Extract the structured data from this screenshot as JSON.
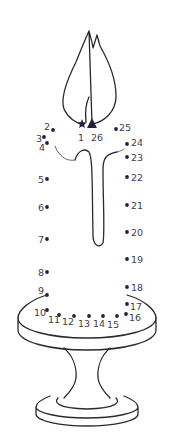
{
  "puzzle": {
    "type": "connect-the-dots",
    "subject": "candle on holder",
    "colors": {
      "dot": "#1e2240",
      "line": "#2a2a2a",
      "label": "#3d3d4a",
      "background": "#ffffff"
    },
    "start_marker": {
      "label": "1",
      "shape": "star",
      "x": 82,
      "y": 124,
      "lx": 78,
      "ly": 141
    },
    "end_marker": {
      "label": "26",
      "shape": "triangle",
      "x": 92,
      "y": 124,
      "lx": 91,
      "ly": 141
    },
    "dots": [
      {
        "label": "2",
        "x": 53,
        "y": 130,
        "lx": 44,
        "ly": 130
      },
      {
        "label": "3",
        "x": 44,
        "y": 137,
        "lx": 36,
        "ly": 142
      },
      {
        "label": "4",
        "x": 47,
        "y": 143,
        "lx": 39,
        "ly": 151
      },
      {
        "label": "5",
        "x": 47,
        "y": 179,
        "lx": 38,
        "ly": 183
      },
      {
        "label": "6",
        "x": 47,
        "y": 207,
        "lx": 38,
        "ly": 211
      },
      {
        "label": "7",
        "x": 47,
        "y": 239,
        "lx": 38,
        "ly": 243
      },
      {
        "label": "8",
        "x": 47,
        "y": 272,
        "lx": 38,
        "ly": 276
      },
      {
        "label": "9",
        "x": 47,
        "y": 295,
        "lx": 38,
        "ly": 294
      },
      {
        "label": "10",
        "x": 47,
        "y": 310,
        "lx": 34,
        "ly": 316
      },
      {
        "label": "11",
        "x": 59,
        "y": 315,
        "lx": 48,
        "ly": 323
      },
      {
        "label": "12",
        "x": 74,
        "y": 316,
        "lx": 62,
        "ly": 325
      },
      {
        "label": "13",
        "x": 89,
        "y": 316,
        "lx": 78,
        "ly": 327
      },
      {
        "label": "14",
        "x": 103,
        "y": 316,
        "lx": 93,
        "ly": 327
      },
      {
        "label": "15",
        "x": 117,
        "y": 316,
        "lx": 107,
        "ly": 328
      },
      {
        "label": "16",
        "x": 126,
        "y": 314,
        "lx": 129,
        "ly": 321
      },
      {
        "label": "17",
        "x": 127,
        "y": 304,
        "lx": 130,
        "ly": 310
      },
      {
        "label": "18",
        "x": 127,
        "y": 287,
        "lx": 131,
        "ly": 291
      },
      {
        "label": "19",
        "x": 127,
        "y": 259,
        "lx": 131,
        "ly": 263
      },
      {
        "label": "20",
        "x": 127,
        "y": 232,
        "lx": 131,
        "ly": 236
      },
      {
        "label": "21",
        "x": 127,
        "y": 205,
        "lx": 131,
        "ly": 209
      },
      {
        "label": "22",
        "x": 127,
        "y": 177,
        "lx": 131,
        "ly": 181
      },
      {
        "label": "23",
        "x": 127,
        "y": 157,
        "lx": 131,
        "ly": 161
      },
      {
        "label": "24",
        "x": 127,
        "y": 144,
        "lx": 131,
        "ly": 146
      },
      {
        "label": "25",
        "x": 116,
        "y": 129,
        "lx": 119,
        "ly": 131
      }
    ]
  }
}
